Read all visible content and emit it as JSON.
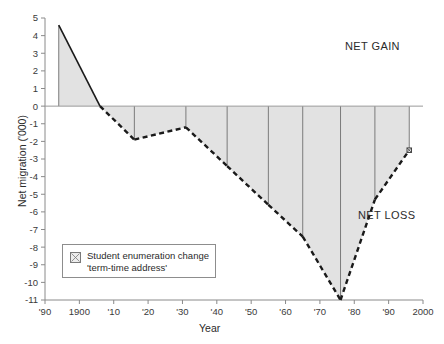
{
  "chart_data": {
    "type": "area",
    "title": "",
    "xlabel": "Year",
    "ylabel": "Net migration ('000)",
    "xlim": [
      1890,
      2000
    ],
    "ylim": [
      -11,
      5
    ],
    "grid": false,
    "legend_position": "inside-lower-left",
    "x_tick_labels": [
      "'90",
      "1900",
      "'10",
      "'20",
      "'30",
      "'40",
      "'50",
      "'60",
      "'70",
      "'80",
      "'90",
      "2000"
    ],
    "x_tick_values": [
      1890,
      1900,
      1910,
      1920,
      1930,
      1940,
      1950,
      1960,
      1970,
      1980,
      1990,
      2000
    ],
    "y_tick_labels": [
      "5",
      "4",
      "3",
      "2",
      "1",
      "0",
      "-1",
      "-2",
      "-3",
      "-4",
      "-5",
      "-6",
      "-7",
      "-8",
      "-9",
      "-10",
      "-11"
    ],
    "y_tick_values": [
      5,
      4,
      3,
      2,
      1,
      0,
      -1,
      -2,
      -3,
      -4,
      -5,
      -6,
      -7,
      -8,
      -9,
      -10,
      -11
    ],
    "x": [
      1894,
      1906,
      1916,
      1931,
      1943,
      1955,
      1965,
      1976,
      1986,
      1996
    ],
    "values": [
      4.6,
      0.0,
      -1.9,
      -1.2,
      -3.4,
      -5.6,
      -7.4,
      -11.0,
      -5.3,
      -2.5
    ],
    "series": [
      {
        "name": "Net migration",
        "values": [
          4.6,
          0.0,
          -1.9,
          -1.2,
          -3.4,
          -5.6,
          -7.4,
          -11.0,
          -5.3,
          -2.5
        ]
      }
    ],
    "marker_points": [
      {
        "x": 1996,
        "y": -2.5,
        "symbol": "square-crossed"
      }
    ],
    "stem_years": [
      1894,
      1916,
      1931,
      1943,
      1955,
      1965,
      1976,
      1986,
      1996
    ],
    "annotations": [
      {
        "text": "NET GAIN",
        "x": 1985,
        "y": 3.6
      },
      {
        "text": "NET LOSS",
        "x": 1982,
        "y": -6.1
      }
    ],
    "fill_color": "#e2e2e2",
    "line_color": "#1a1a1a",
    "axis_color": "#8a8a8a"
  },
  "legend": {
    "marker_name": "student-enumeration-marker",
    "line1": "Student enumeration change",
    "line2": "'term-time address'"
  },
  "annotations": {
    "net_gain": "NET GAIN",
    "net_loss": "NET LOSS"
  },
  "axes": {
    "x_title": "Year",
    "y_title": "Net migration ('000)"
  }
}
